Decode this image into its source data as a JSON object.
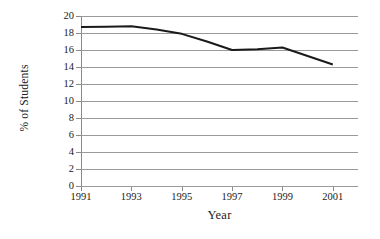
{
  "chart_data": {
    "type": "line",
    "title": "",
    "xlabel": "Year",
    "ylabel": "% of Students",
    "x": [
      1991,
      1992,
      1993,
      1994,
      1995,
      1996,
      1997,
      1998,
      1999,
      2000,
      2001
    ],
    "values": [
      18.7,
      18.75,
      18.8,
      18.4,
      17.9,
      17.0,
      16.0,
      16.1,
      16.3,
      15.3,
      14.3
    ],
    "series": [
      {
        "name": "% of Students",
        "values": [
          18.7,
          18.75,
          18.8,
          18.4,
          17.9,
          17.0,
          16.0,
          16.1,
          16.3,
          15.3,
          14.3
        ]
      }
    ],
    "xlim": [
      1991,
      2002
    ],
    "ylim": [
      0,
      20
    ],
    "y_ticks": [
      0,
      2,
      4,
      6,
      8,
      10,
      12,
      14,
      16,
      18,
      20
    ],
    "x_ticks": [
      1991,
      1993,
      1995,
      1997,
      1999,
      2001
    ],
    "x_tick_labels": [
      "1991",
      "1993",
      "1995",
      "1997",
      "1999",
      "2001"
    ],
    "y_tick_labels": [
      "0",
      "2",
      "4",
      "6",
      "8",
      "10",
      "12",
      "14",
      "16",
      "18",
      "20"
    ],
    "grid": true,
    "grid_axis": "y",
    "legend": false,
    "legend_position": "none",
    "line_color": "#1a1a1a",
    "gridline_color": "#9a9a9a",
    "axis_color": "#8a8a8a",
    "background_color": "#ffffff"
  }
}
